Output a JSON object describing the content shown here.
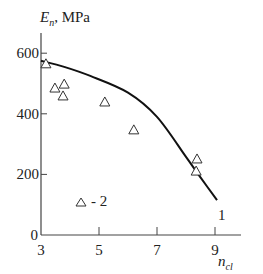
{
  "chart_data": {
    "type": "scatter",
    "title": "",
    "ylabel": {
      "main": "E",
      "sub": "n",
      "unit": ", MPa"
    },
    "xlabel": {
      "main": "n",
      "sub": "cl"
    },
    "xlim": [
      3,
      10
    ],
    "ylim": [
      0,
      650
    ],
    "x_ticks": [
      3,
      5,
      7,
      9
    ],
    "y_ticks": [
      0,
      200,
      400,
      600
    ],
    "grid": false,
    "series": [
      {
        "name": "1",
        "kind": "line",
        "label": "1",
        "points": [
          [
            3.0,
            575
          ],
          [
            3.8,
            555
          ],
          [
            4.7,
            525
          ],
          [
            6.0,
            470
          ],
          [
            7.0,
            390
          ],
          [
            8.0,
            258
          ],
          [
            8.5,
            190
          ],
          [
            9.07,
            115
          ]
        ]
      },
      {
        "name": "2",
        "kind": "scatter",
        "marker": "triangle",
        "points": [
          [
            3.17,
            565
          ],
          [
            3.48,
            485
          ],
          [
            3.8,
            498
          ],
          [
            3.76,
            459
          ],
          [
            5.2,
            439
          ],
          [
            6.2,
            347
          ],
          [
            8.38,
            251
          ],
          [
            8.35,
            211
          ]
        ]
      }
    ],
    "legend": {
      "entries": [
        {
          "marker": "triangle",
          "text": "- 2"
        }
      ],
      "placement": "bottom-left"
    }
  }
}
